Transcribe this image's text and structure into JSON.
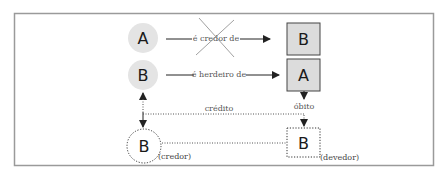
{
  "colors": {
    "frame": "#9a9a9a",
    "circle_fill": "#e4e4e4",
    "box_fill": "#dcdcdc",
    "box_stroke": "#444444",
    "line": "#222222",
    "dotted": "#555555",
    "cross": "#888888"
  },
  "nodes": {
    "circle_a": {
      "label": "A"
    },
    "circle_b": {
      "label": "B"
    },
    "box_b": {
      "label": "B"
    },
    "box_a": {
      "label": "A"
    },
    "dotted_circle_b": {
      "label": "B",
      "role": "(credor)"
    },
    "dotted_box_b": {
      "label": "B",
      "role": "(devedor)"
    }
  },
  "edges": {
    "creditor": {
      "label": "é credor de",
      "crossed_out": true
    },
    "heir": {
      "label": "é herdeiro de"
    },
    "death": {
      "label": "óbito"
    },
    "credit": {
      "label": "crédito"
    }
  }
}
